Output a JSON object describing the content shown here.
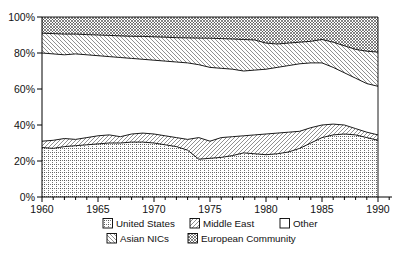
{
  "chart_data": {
    "type": "area",
    "stacked": true,
    "title": "",
    "xlabel": "",
    "ylabel": "",
    "xlim": [
      1960,
      1990
    ],
    "ylim": [
      0,
      100
    ],
    "grid": false,
    "x": [
      1960,
      1961,
      1962,
      1963,
      1964,
      1965,
      1966,
      1967,
      1968,
      1969,
      1970,
      1971,
      1972,
      1973,
      1974,
      1975,
      1976,
      1977,
      1978,
      1979,
      1980,
      1981,
      1982,
      1983,
      1984,
      1985,
      1986,
      1987,
      1988,
      1989,
      1990
    ],
    "x_tick_labels": [
      "1960",
      "1965",
      "1970",
      "1975",
      "1980",
      "1985",
      "1990"
    ],
    "x_tick_values": [
      1960,
      1965,
      1970,
      1975,
      1980,
      1985,
      1990
    ],
    "y_tick_labels": [
      "0%",
      "20%",
      "40%",
      "60%",
      "80%",
      "100%"
    ],
    "y_tick_values": [
      0,
      20,
      40,
      60,
      80,
      100
    ],
    "series": [
      {
        "name": "United States",
        "pattern": "dotted-grid",
        "values": [
          27.5,
          27,
          28,
          28.5,
          29,
          29.5,
          30,
          30,
          30.5,
          30.5,
          30,
          29,
          28,
          26,
          21,
          21.5,
          22,
          23,
          24.5,
          24,
          23.5,
          24,
          25,
          27,
          30,
          33,
          34.5,
          35,
          34.5,
          33,
          31.5
        ]
      },
      {
        "name": "Middle East",
        "pattern": "diagonal-forward",
        "values": [
          3.5,
          4.5,
          4.5,
          3.5,
          4,
          4.5,
          4.5,
          3.5,
          4.5,
          5,
          5,
          5,
          5,
          6,
          12,
          9.5,
          11,
          10.5,
          9.5,
          10.5,
          11.5,
          11.5,
          11,
          9.5,
          8.5,
          7,
          6,
          5,
          3.5,
          3,
          3
        ]
      },
      {
        "name": "Other",
        "pattern": "white",
        "values": [
          49,
          48,
          46.5,
          47.5,
          46,
          44.5,
          43.5,
          44,
          42,
          41,
          41,
          41.5,
          42,
          42.5,
          40.5,
          41,
          38.5,
          37.5,
          36,
          36,
          36,
          36.5,
          37,
          37.5,
          36,
          34.5,
          31.5,
          29,
          28,
          27,
          27
        ]
      },
      {
        "name": "Asian NICs",
        "pattern": "diagonal-back",
        "values": [
          11,
          11.3,
          11.5,
          11,
          11.2,
          11.5,
          11.8,
          12,
          12.3,
          12.7,
          13,
          13.3,
          13.5,
          13.9,
          14.8,
          16.2,
          16.5,
          16.8,
          17.5,
          16.7,
          14.5,
          13,
          12.5,
          12,
          12,
          13,
          14,
          15,
          16,
          18,
          19
        ]
      },
      {
        "name": "European Community",
        "pattern": "crosshatch",
        "values": [
          9,
          9.2,
          9.5,
          9.5,
          9.8,
          10,
          10.2,
          10.5,
          10.7,
          10.8,
          11,
          11.2,
          11.5,
          11.6,
          11.7,
          11.8,
          12,
          12.2,
          12.5,
          12.8,
          14.5,
          15,
          14.5,
          14,
          13.5,
          12.5,
          14,
          16,
          18,
          19,
          19.5
        ]
      }
    ],
    "legend": {
      "position": "bottom",
      "rows": [
        [
          "United States",
          "Middle East",
          "Other"
        ],
        [
          "Asian NICs",
          "European Community"
        ]
      ]
    },
    "line_color": "#000000",
    "background_color": "#ffffff"
  }
}
